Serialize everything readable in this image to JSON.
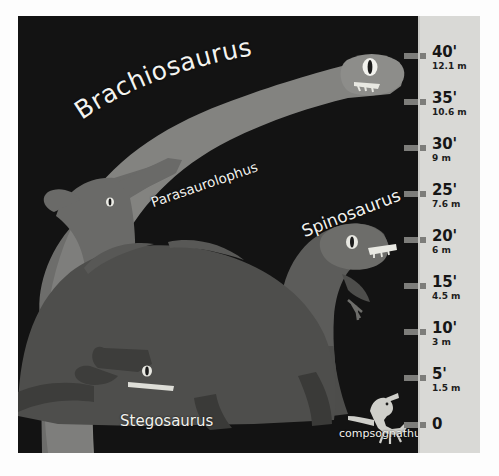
{
  "figure": {
    "background_color": "#fdfdfd",
    "panel_color": "#131313",
    "scale_color": "#d9d9d6",
    "label_color": "#f2f2ee"
  },
  "scale": {
    "tick_color": "#7d7d7a",
    "ticks": [
      {
        "feet": "40'",
        "meters": "12.1 m",
        "y": 56
      },
      {
        "feet": "35'",
        "meters": "10.6 m",
        "y": 102
      },
      {
        "feet": "30'",
        "meters": "9 m",
        "y": 148
      },
      {
        "feet": "25'",
        "meters": "7.6 m",
        "y": 194
      },
      {
        "feet": "20'",
        "meters": "6 m",
        "y": 240
      },
      {
        "feet": "15'",
        "meters": "4.5 m",
        "y": 286
      },
      {
        "feet": "10'",
        "meters": "3 m",
        "y": 332
      },
      {
        "feet": "5'",
        "meters": "1.5 m",
        "y": 378
      },
      {
        "feet": "0",
        "meters": "",
        "y": 425
      }
    ]
  },
  "dinosaurs": [
    {
      "name": "Brachiosaurus",
      "fill": "#8d8d8a"
    },
    {
      "name": "Parasaurolophus",
      "fill": "#6a6a68"
    },
    {
      "name": "Spinosaurus",
      "fill": "#5c5c5a"
    },
    {
      "name": "Stegosaurus",
      "fill": "#4e4e4c"
    },
    {
      "name": "compsognathus",
      "fill": "#cfcfca"
    }
  ],
  "chart_data": {
    "type": "bar",
    "xlabel": "",
    "ylabel": "Height",
    "ylim": [
      0,
      40
    ],
    "grid": false,
    "legend": "none",
    "units": {
      "primary": "feet",
      "secondary": "meters"
    },
    "axis_ticks": [
      {
        "feet": 40,
        "meters": 12.1,
        "label_feet": "40'",
        "label_meters": "12.1 m"
      },
      {
        "feet": 35,
        "meters": 10.6,
        "label_feet": "35'",
        "label_meters": "10.6 m"
      },
      {
        "feet": 30,
        "meters": 9.0,
        "label_feet": "30'",
        "label_meters": "9 m"
      },
      {
        "feet": 25,
        "meters": 7.6,
        "label_feet": "25'",
        "label_meters": "7.6 m"
      },
      {
        "feet": 20,
        "meters": 6.0,
        "label_feet": "20'",
        "label_meters": "6 m"
      },
      {
        "feet": 15,
        "meters": 4.5,
        "label_feet": "15'",
        "label_meters": "4.5 m"
      },
      {
        "feet": 10,
        "meters": 3.0,
        "label_feet": "10'",
        "label_meters": "3 m"
      },
      {
        "feet": 5,
        "meters": 1.5,
        "label_feet": "5'",
        "label_meters": "1.5 m"
      },
      {
        "feet": 0,
        "meters": 0,
        "label_feet": "0",
        "label_meters": ""
      }
    ],
    "categories": [
      "Brachiosaurus",
      "Parasaurolophus",
      "Spinosaurus",
      "Stegosaurus",
      "compsognathus"
    ],
    "values": [
      40,
      16,
      21,
      13,
      3
    ],
    "series": [
      {
        "name": "Height (feet)",
        "values": [
          40,
          16,
          21,
          13,
          3
        ]
      },
      {
        "name": "Height (meters)",
        "values": [
          12.1,
          4.9,
          6.4,
          4.0,
          0.9
        ]
      }
    ]
  }
}
